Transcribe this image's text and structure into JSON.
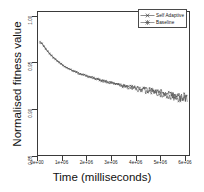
{
  "chart_data": {
    "type": "line",
    "title": "",
    "xlabel": "Time (milliseconds)",
    "ylabel": "Normalised fitness value",
    "xlim": [
      0,
      6200000
    ],
    "ylim": [
      0.85,
      1.005
    ],
    "grid": false,
    "legend_position": "top-right",
    "xticks": [
      0,
      1000000,
      2000000,
      3000000,
      4000000,
      5000000,
      6000000
    ],
    "xticklabels": [
      "0e+00",
      "1e+06",
      "2e+06",
      "3e+06",
      "4e+06",
      "5e+06",
      "6e+06"
    ],
    "yticks": [
      0.85,
      0.9,
      0.95,
      1.0
    ],
    "yticklabels": [
      "0.85",
      "0.90",
      "0.95",
      "1.00"
    ],
    "series": [
      {
        "name": "Self Adaptive",
        "color": "#3c3c3c",
        "x": [
          80000,
          150000,
          230000,
          320000,
          420000,
          530000,
          650000,
          780000,
          920000,
          1070000,
          1230000,
          1400000,
          1580000,
          1770000,
          1970000,
          2180000,
          2400000,
          2630000,
          2870000,
          3120000,
          3380000,
          3650000,
          3930000,
          4220000,
          4520000,
          4830000,
          5150000,
          5480000,
          5820000,
          6050000
        ],
        "y": [
          0.9735,
          0.972,
          0.969,
          0.966,
          0.9625,
          0.959,
          0.956,
          0.953,
          0.95,
          0.9472,
          0.9448,
          0.9425,
          0.9404,
          0.9385,
          0.9368,
          0.935,
          0.9334,
          0.9318,
          0.9302,
          0.9288,
          0.9272,
          0.9258,
          0.9242,
          0.9228,
          0.9212,
          0.9196,
          0.918,
          0.9162,
          0.9144,
          0.9132
        ]
      },
      {
        "name": "Baseline",
        "color": "#555555",
        "x": [
          80000,
          150000,
          230000,
          320000,
          420000,
          530000,
          650000,
          780000,
          920000,
          1070000,
          1230000,
          1400000,
          1580000,
          1770000,
          1970000,
          2180000,
          2400000,
          2630000,
          2870000,
          3120000,
          3380000,
          3650000,
          3930000,
          4220000,
          4520000,
          4830000,
          5150000,
          5480000,
          5820000,
          6050000
        ],
        "y": [
          0.972,
          0.9712,
          0.9684,
          0.9652,
          0.9618,
          0.9584,
          0.9554,
          0.9524,
          0.9495,
          0.9468,
          0.9444,
          0.9421,
          0.94,
          0.9381,
          0.9364,
          0.9346,
          0.9328,
          0.9312,
          0.9295,
          0.928,
          0.9263,
          0.9247,
          0.923,
          0.9214,
          0.9197,
          0.918,
          0.9162,
          0.9144,
          0.9124,
          0.911
        ]
      }
    ],
    "legend": [
      "Self Adaptive",
      "Baseline"
    ]
  }
}
